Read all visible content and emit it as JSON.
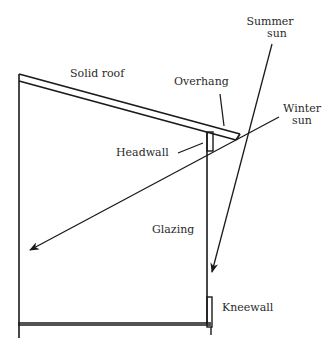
{
  "diagram": {
    "type": "sunspace-cross-section",
    "colors": {
      "line": "#1a1a1a",
      "text": "#2a2a2a",
      "background": "#ffffff"
    },
    "labels": {
      "solid_roof": "Solid roof",
      "overhang": "Overhang",
      "summer_sun_line1": "Summer",
      "summer_sun_line2": "sun",
      "winter_sun_line1": "Winter",
      "winter_sun_line2": "sun",
      "headwall": "Headwall",
      "glazing": "Glazing",
      "kneewall": "Kneewall"
    },
    "components": [
      {
        "id": "solid-roof",
        "label": "Solid roof"
      },
      {
        "id": "overhang",
        "label": "Overhang"
      },
      {
        "id": "headwall",
        "label": "Headwall"
      },
      {
        "id": "glazing",
        "label": "Glazing"
      },
      {
        "id": "kneewall",
        "label": "Kneewall"
      }
    ],
    "rays": [
      {
        "id": "summer-sun",
        "label": "Summer sun",
        "direction": "steep, stopped by overhang near glazing"
      },
      {
        "id": "winter-sun",
        "label": "Winter sun",
        "direction": "low angle, penetrates deep into space"
      }
    ]
  }
}
